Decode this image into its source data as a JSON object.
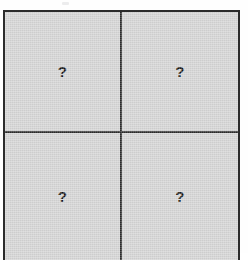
{
  "figure": {
    "kind": "2x2-grid",
    "rows": 2,
    "columns": 2,
    "border_color": "#2b2b2b",
    "cell_fill_color": "#d2d2d2",
    "mark_color": "#141414",
    "page_background": "#ffffff",
    "cells": [
      {
        "id": "top-left",
        "row": 1,
        "column": 1,
        "mark": "?"
      },
      {
        "id": "top-right",
        "row": 1,
        "column": 2,
        "mark": "?"
      },
      {
        "id": "bottom-left",
        "row": 2,
        "column": 1,
        "mark": "?"
      },
      {
        "id": "bottom-right",
        "row": 2,
        "column": 2,
        "mark": "?"
      }
    ]
  }
}
